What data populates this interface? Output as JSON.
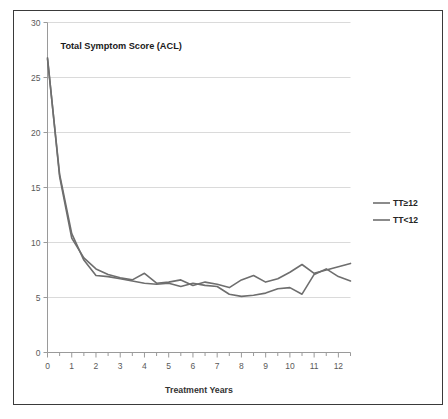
{
  "chart_data": {
    "type": "line",
    "title": "Total Symptom  Score (ACL)",
    "xlabel": "Treatment Years",
    "ylabel": "",
    "xlim": [
      0,
      12.5
    ],
    "ylim": [
      0,
      30
    ],
    "ytick_labels": [
      "0",
      "5",
      "10",
      "15",
      "20",
      "25",
      "30"
    ],
    "yticks": [
      0,
      5,
      10,
      15,
      20,
      25,
      30
    ],
    "xtick_labels": [
      "0",
      "1",
      "2",
      "3",
      "4",
      "5",
      "6",
      "7",
      "8",
      "9",
      "10",
      "11",
      "12"
    ],
    "xticks": [
      0,
      1,
      2,
      3,
      4,
      5,
      6,
      7,
      8,
      9,
      10,
      11,
      12
    ],
    "x_minor_tick_step": 0.5,
    "grid": "horizontal",
    "grid_color": "#d0d0d0",
    "legend_position": "right",
    "series": [
      {
        "name": "TT≥12",
        "color": "#6e6e6e",
        "x": [
          0,
          0.5,
          1,
          1.5,
          2,
          2.5,
          3,
          3.5,
          4,
          4.5,
          5,
          5.5,
          6,
          6.5,
          7,
          7.5,
          8,
          8.5,
          9,
          9.5,
          10,
          10.5,
          11,
          11.5,
          12,
          12.5
        ],
        "values": [
          26.8,
          16.0,
          10.4,
          8.6,
          7.6,
          7.1,
          6.8,
          6.6,
          7.2,
          6.3,
          6.4,
          6.6,
          6.1,
          6.4,
          6.2,
          5.9,
          6.6,
          7.0,
          6.4,
          6.7,
          7.3,
          8.0,
          7.2,
          7.5,
          7.8,
          8.1
        ]
      },
      {
        "name": "TT<12",
        "color": "#6e6e6e",
        "x": [
          0,
          0.5,
          1,
          1.5,
          2,
          2.5,
          3,
          3.5,
          4,
          4.5,
          5,
          5.5,
          6,
          6.5,
          7,
          7.5,
          8,
          8.5,
          9,
          9.5,
          10,
          10.5,
          11,
          11.5,
          12,
          12.5
        ],
        "values": [
          26.7,
          16.2,
          10.8,
          8.4,
          7.0,
          6.9,
          6.7,
          6.5,
          6.3,
          6.2,
          6.3,
          6.0,
          6.3,
          6.1,
          6.0,
          5.3,
          5.1,
          5.2,
          5.4,
          5.8,
          5.9,
          5.3,
          7.1,
          7.6,
          6.9,
          6.5
        ]
      }
    ]
  }
}
